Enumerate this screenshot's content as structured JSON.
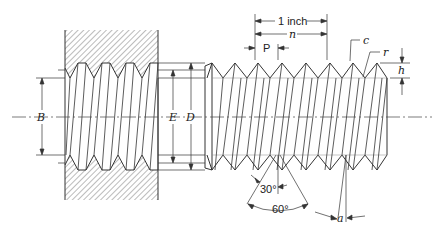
{
  "figure": {
    "labels": {
      "B": "B",
      "E": "E",
      "D": "D",
      "one_inch": "1 inch",
      "n": "n",
      "P": "P",
      "c": "c",
      "r": "r",
      "h": "h",
      "angle_30": "30°",
      "angle_60": "60°",
      "a": "a"
    },
    "colors": {
      "line": "#333333",
      "hatch": "#555555",
      "background": "#ffffff"
    }
  }
}
